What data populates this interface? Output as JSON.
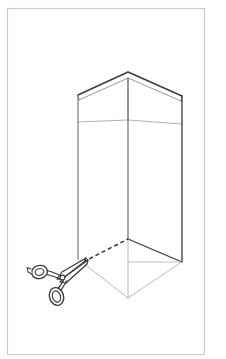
{
  "figure": {
    "description": "Black-and-white line drawing showing a tall open-topped rectangular box in three-quarter perspective, with a dashed cut line along the lower-left bottom edge and an open pair of scissors cutting along that line.",
    "canvas": {
      "width": 226,
      "height": 359,
      "background": "#ffffff"
    },
    "border": {
      "name": "figure-border",
      "color": "#c9c9c9",
      "stroke_width": 1.2,
      "x": 7.5,
      "y": 8.5,
      "width": 197,
      "height": 346
    },
    "colors": {
      "outline_dark": "#3a3a3a",
      "outline_mid": "#6e6e6e",
      "outline_light": "#9a9a9a",
      "cut_line": "#2e2e2e",
      "scissors_stroke": "#3a3a3a",
      "fill": "none",
      "background": "#ffffff"
    },
    "objects": [
      {
        "name": "open-box",
        "label": "Open cardboard box",
        "type": "rectangular-prism",
        "vertices": {
          "top_back_apex": [
            128,
            72
          ],
          "top_left": [
            78,
            95
          ],
          "top_right": [
            182,
            96
          ],
          "top_front": [
            128,
            120
          ],
          "bottom_back": [
            128,
            239
          ],
          "bottom_left": [
            78,
            259
          ],
          "bottom_right": [
            182,
            262
          ],
          "bottom_front": [
            128,
            298
          ]
        },
        "rim_band": {
          "label": "Inner rim / flap band",
          "left_y": 122,
          "right_y": 124,
          "apex_y": 100
        }
      },
      {
        "name": "cut-line",
        "label": "Dashed cut line along bottom edge",
        "style": "dashed",
        "dash_pattern": "4 3",
        "from": [
          84,
          262
        ],
        "to": [
          128,
          239
        ]
      },
      {
        "name": "scissors",
        "label": "Open scissors cutting the box",
        "angle_deg": -38,
        "parts": [
          "upper-blade",
          "lower-blade",
          "pivot-screw",
          "upper-handle-ring",
          "lower-handle-ring"
        ],
        "blade_tip": [
          86,
          258
        ],
        "pivot": [
          62,
          275
        ],
        "ring_upper_center": [
          40,
          270
        ],
        "ring_lower_center": [
          58,
          293
        ]
      }
    ]
  }
}
